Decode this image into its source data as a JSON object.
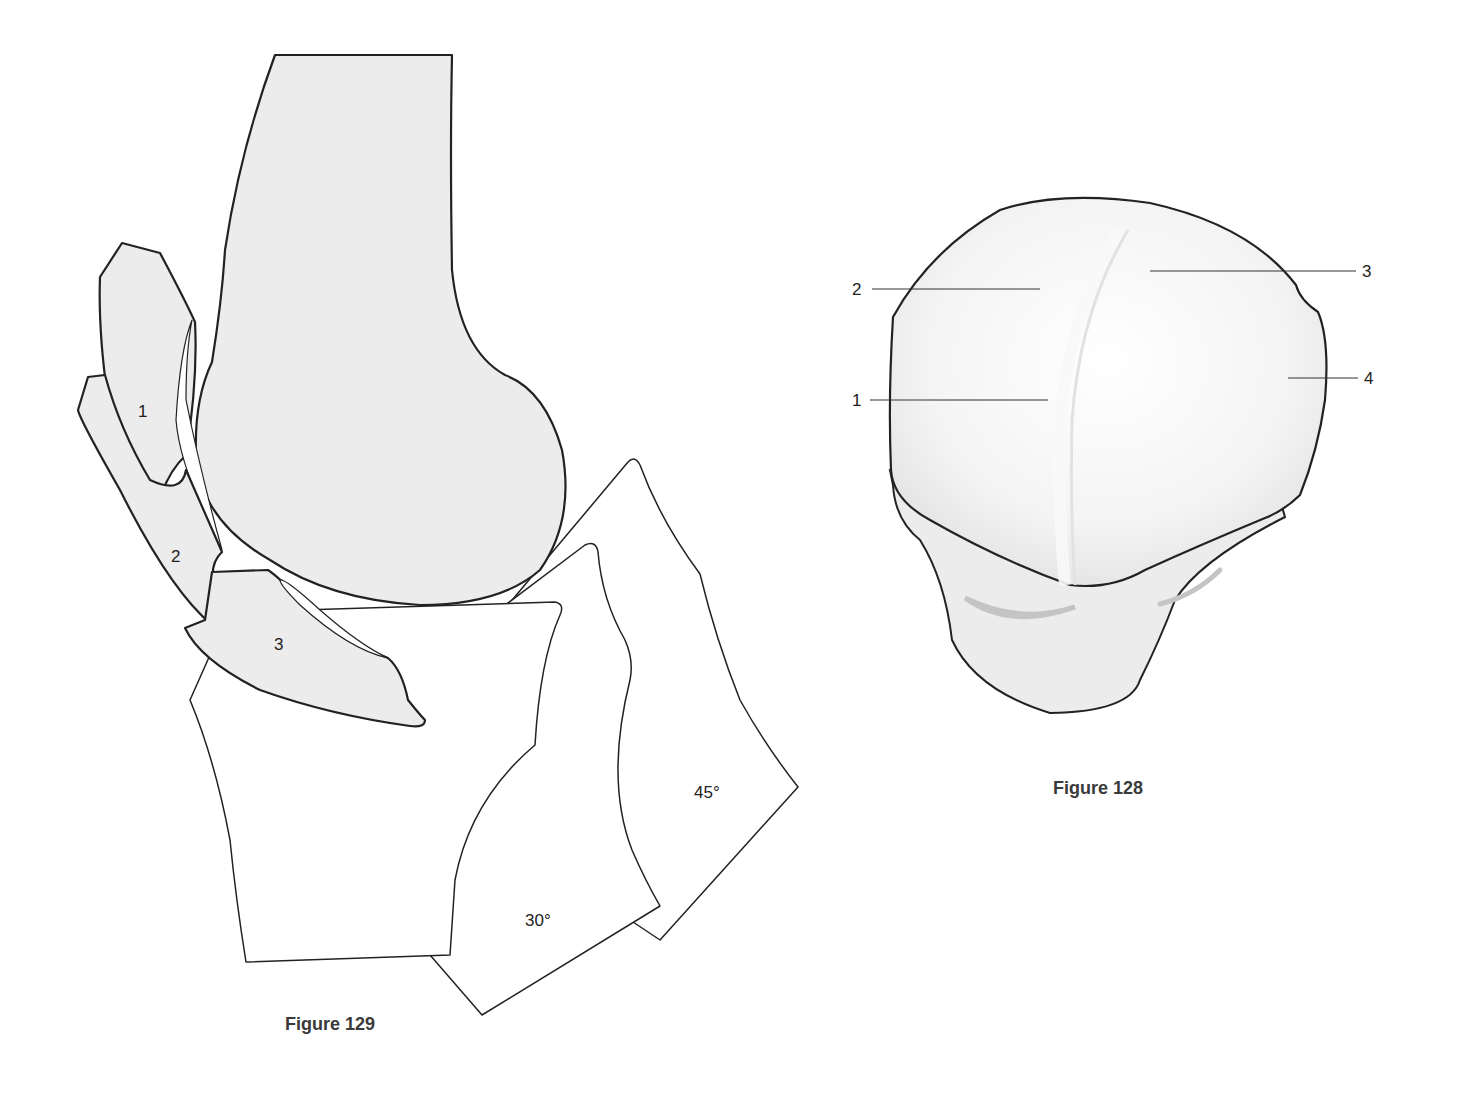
{
  "figures": [
    {
      "id": "figure-129",
      "caption": "Figure 129",
      "description": "Lateral view of knee: femur with patella positions at increasing flexion; tibia silhouettes at 0°, 30°, 45°",
      "patella_labels": [
        "1",
        "2",
        "3"
      ],
      "angle_labels": [
        "30°",
        "45°"
      ],
      "colors": {
        "bone_fill": "#ececec",
        "outline": "#222222",
        "tibia_fill": "#ffffff"
      }
    },
    {
      "id": "figure-128",
      "caption": "Figure 128",
      "description": "Axial view of patella over femoral trochlea with numbered facets",
      "labels": [
        "1",
        "2",
        "3",
        "4"
      ],
      "colors": {
        "fill": "#efefef",
        "groove": "#c8c8c8",
        "outline": "#222222"
      }
    }
  ]
}
